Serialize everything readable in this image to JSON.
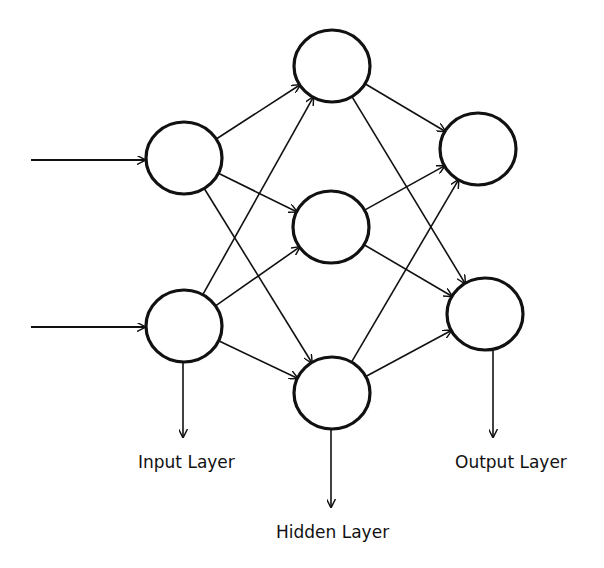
{
  "diagram": {
    "type": "neural-network",
    "labels": {
      "input": "Input Layer",
      "hidden": "Hidden Layer",
      "output": "Output Layer"
    },
    "layers": {
      "input": [
        {
          "id": "i1",
          "cx": 184,
          "cy": 158
        },
        {
          "id": "i2",
          "cx": 184,
          "cy": 326
        }
      ],
      "hidden": [
        {
          "id": "h1",
          "cx": 332,
          "cy": 66
        },
        {
          "id": "h2",
          "cx": 331,
          "cy": 227
        },
        {
          "id": "h3",
          "cx": 332,
          "cy": 393
        }
      ],
      "output": [
        {
          "id": "o1",
          "cx": 478,
          "cy": 149
        },
        {
          "id": "o2",
          "cx": 485,
          "cy": 314
        }
      ]
    },
    "node_radius": {
      "rx": 38,
      "ry": 36
    },
    "edges": [
      [
        "i1",
        "h1"
      ],
      [
        "i1",
        "h2"
      ],
      [
        "i1",
        "h3"
      ],
      [
        "i2",
        "h1"
      ],
      [
        "i2",
        "h2"
      ],
      [
        "i2",
        "h3"
      ],
      [
        "h1",
        "o1"
      ],
      [
        "h1",
        "o2"
      ],
      [
        "h2",
        "o1"
      ],
      [
        "h2",
        "o2"
      ],
      [
        "h3",
        "o1"
      ],
      [
        "h3",
        "o2"
      ]
    ],
    "stroke_color": "#111111"
  }
}
